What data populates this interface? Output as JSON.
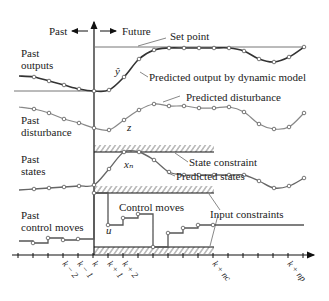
{
  "labels": {
    "past": "Past",
    "future": "Future",
    "set_point": "Set point",
    "past_outputs_1": "Past",
    "past_outputs_2": "outputs",
    "predicted_output": "Predicted output by dynamic model",
    "y_hat": "ŷ",
    "past_disturbance_1": "Past",
    "past_disturbance_2": "disturbance",
    "predicted_disturbance": "Predicted disturbance",
    "z": "z",
    "past_states_1": "Past",
    "past_states_2": "states",
    "x_n": "xₙ",
    "state_constraint": "State constraint",
    "predicted_states": "Predicted states",
    "past_control_1": "Past",
    "past_control_2": "control moves",
    "control_moves": "Control moves",
    "u": "u",
    "input_constraints": "Input constraints"
  },
  "time_ticks": [
    "k − 2",
    "k − 1",
    "k",
    "k + 1",
    "k + 2",
    "k + n_c",
    "k + n_p"
  ],
  "tick_labels": {
    "km2": "k − 2",
    "km1": "k − 1",
    "k": "k",
    "kp1": "k + 1",
    "kp2": "k + 2",
    "knc": "k + nc",
    "knp": "k + np"
  }
}
